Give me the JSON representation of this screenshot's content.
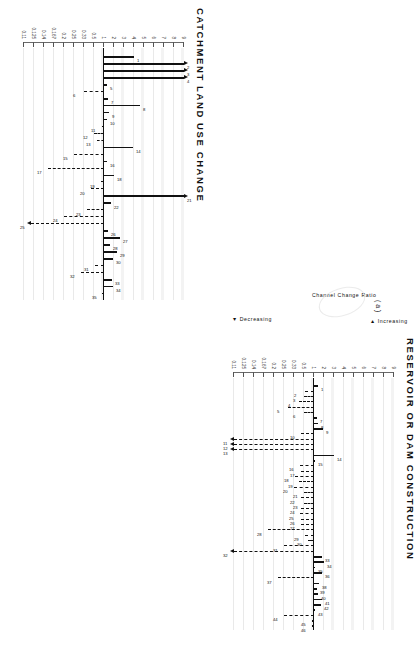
{
  "figure": {
    "subfigure_label": "( a )",
    "orientation": "rotated-90-ccw"
  },
  "axis": {
    "caption": "Channel Change Ratio",
    "increasing_label": "Increasing",
    "decreasing_label": "Decreasing",
    "ticks": [
      "9",
      "8",
      "7",
      "6",
      "5",
      "4",
      "3",
      "2",
      "1",
      "0.5",
      "0.33",
      "0.25",
      "0.2",
      "0.167",
      "0.14",
      "0.125",
      "0.11"
    ],
    "tick_values": [
      9,
      8,
      7,
      6,
      5,
      4,
      3,
      2,
      1,
      0.5,
      0.33,
      0.25,
      0.2,
      0.167,
      0.14,
      0.125,
      0.11
    ],
    "baseline_value": 1
  },
  "chart_data": [
    {
      "type": "bar",
      "title": "CATCHMENT LAND USE CHANGE",
      "xlabel": "",
      "ylabel": "Channel Change Ratio",
      "ylim": [
        0.11,
        9
      ],
      "scale": "log-reciprocal",
      "grid": true,
      "categories": [
        "1",
        "2",
        "3",
        "4",
        "5",
        "6",
        "7",
        "8",
        "9",
        "10",
        "11",
        "12",
        "13",
        "14",
        "15",
        "16",
        "17",
        "18",
        "19",
        "20",
        "21",
        "22",
        "23",
        "24",
        "25",
        "26",
        "27",
        "28",
        "29",
        "30",
        "31",
        "32",
        "33",
        "34",
        "35"
      ],
      "values": [
        4.0,
        9.0,
        9.0,
        9.0,
        1.25,
        0.33,
        1.3,
        4.6,
        1.45,
        1.2,
        0.9,
        0.5,
        0.6,
        3.9,
        0.25,
        1.2,
        0.15,
        2.0,
        0.8,
        0.45,
        9.0,
        1.6,
        0.38,
        0.2,
        0.12,
        1.35,
        2.6,
        1.5,
        2.3,
        1.9,
        0.55,
        0.3,
        1.8,
        1.85,
        0.95
      ],
      "direction": [
        "inc",
        "inc",
        "inc",
        "inc",
        "inc",
        "dec",
        "inc",
        "inc",
        "inc",
        "inc",
        "dec",
        "dec",
        "dec",
        "inc",
        "dec",
        "inc",
        "dec",
        "inc",
        "dec",
        "dec",
        "inc",
        "inc",
        "dec",
        "dec",
        "dec",
        "inc",
        "inc",
        "inc",
        "inc",
        "inc",
        "dec",
        "dec",
        "inc",
        "inc",
        "dec"
      ],
      "off_scale": [
        "2",
        "3",
        "4",
        "21",
        "25"
      ],
      "notes": "Solid bars = channel enlargement (increasing); dashed bars = channel contraction (decreasing). Arrowheads mark values beyond the plotted range."
    },
    {
      "type": "bar",
      "title": "RESERVOIR OR DAM CONSTRUCTION",
      "xlabel": "",
      "ylabel": "Channel Change Ratio",
      "ylim": [
        0.11,
        9
      ],
      "scale": "log-reciprocal",
      "grid": true,
      "categories": [
        "1",
        "2",
        "3",
        "4",
        "5",
        "6",
        "7",
        "8",
        "9",
        "10",
        "11",
        "12",
        "13",
        "14",
        "15",
        "16",
        "17",
        "18",
        "19",
        "20",
        "21",
        "22",
        "23",
        "24",
        "25",
        "26",
        "27",
        "28",
        "29",
        "30",
        "31",
        "32",
        "33",
        "34",
        "35",
        "36",
        "37",
        "38",
        "39",
        "40",
        "41",
        "42",
        "43",
        "44",
        "45",
        "46"
      ],
      "values": [
        1.3,
        0.55,
        0.5,
        0.4,
        0.28,
        0.5,
        1.25,
        1.35,
        1.9,
        0.45,
        0.11,
        0.11,
        0.11,
        3.0,
        1.1,
        0.42,
        0.45,
        0.35,
        0.4,
        0.33,
        0.5,
        0.45,
        0.5,
        0.45,
        0.42,
        0.45,
        0.45,
        0.18,
        0.55,
        0.65,
        0.25,
        0.11,
        1.7,
        2.0,
        1.05,
        1.8,
        0.22,
        1.45,
        1.2,
        1.35,
        1.7,
        1.6,
        1.1,
        0.25,
        0.85,
        0.9
      ],
      "direction": [
        "inc",
        "dec",
        "dec",
        "dec",
        "dec",
        "dec",
        "inc",
        "inc",
        "inc",
        "dec",
        "dec",
        "dec",
        "dec",
        "inc",
        "inc",
        "dec",
        "dec",
        "dec",
        "dec",
        "dec",
        "dec",
        "dec",
        "dec",
        "dec",
        "dec",
        "dec",
        "dec",
        "dec",
        "dec",
        "dec",
        "dec",
        "dec",
        "inc",
        "inc",
        "inc",
        "inc",
        "dec",
        "inc",
        "inc",
        "inc",
        "inc",
        "inc",
        "inc",
        "dec",
        "inc",
        "inc"
      ],
      "off_scale": [
        "11",
        "12",
        "13",
        "32"
      ],
      "notes": "Solid bars = channel enlargement (increasing); dashed bars = channel contraction (decreasing). Arrowheads mark values beyond the plotted range."
    }
  ]
}
